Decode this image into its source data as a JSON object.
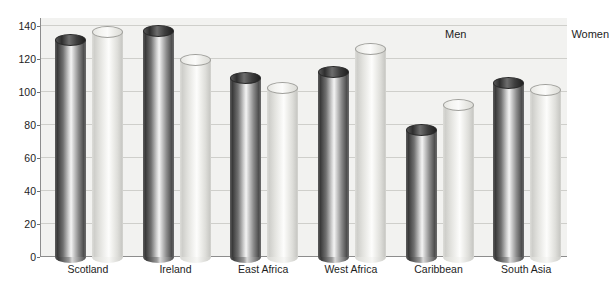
{
  "chart_data": {
    "type": "bar",
    "title": "",
    "xlabel": "",
    "ylabel": "",
    "ylim": [
      0,
      145
    ],
    "yticks": [
      0,
      20,
      40,
      60,
      80,
      100,
      120,
      140
    ],
    "grid": true,
    "legend_position": "top-right",
    "categories": [
      "Scotland",
      "Ireland",
      "East Africa",
      "West Africa",
      "Caribbean",
      "South Asia"
    ],
    "series": [
      {
        "name": "Men",
        "color": "#4f4f4f",
        "values": [
          135,
          141,
          112,
          116,
          81,
          109
        ]
      },
      {
        "name": "Women",
        "color": "#ededea",
        "values": [
          140,
          123,
          106,
          130,
          96,
          105
        ]
      }
    ]
  },
  "legend": {
    "items": [
      {
        "label": "Men",
        "swatch": "dark-cylinder-swatch"
      },
      {
        "label": "Women",
        "swatch": "light-cylinder-swatch"
      }
    ]
  }
}
